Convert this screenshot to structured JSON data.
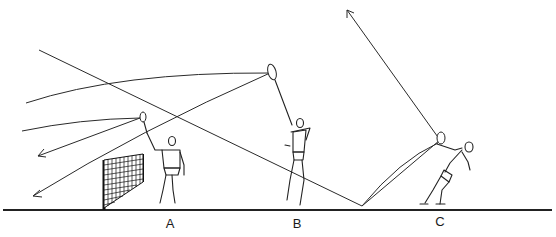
{
  "diagram": {
    "type": "badminton stroke trajectories illustration",
    "colors": {
      "background": "#ffffff",
      "ink": "#222222"
    },
    "players": [
      {
        "id": "A",
        "label": "A",
        "position": "near net",
        "stroke": "net shot / drive"
      },
      {
        "id": "B",
        "label": "B",
        "position": "mid court",
        "stroke": "overhead clear"
      },
      {
        "id": "C",
        "label": "C",
        "position": "rear court",
        "stroke": "underhand lift"
      }
    ],
    "labels": {
      "a": "A",
      "b": "B",
      "c": "C"
    },
    "elements": [
      "ground-line",
      "net",
      "shuttle-trajectories",
      "arrowheads",
      "rackets"
    ]
  }
}
